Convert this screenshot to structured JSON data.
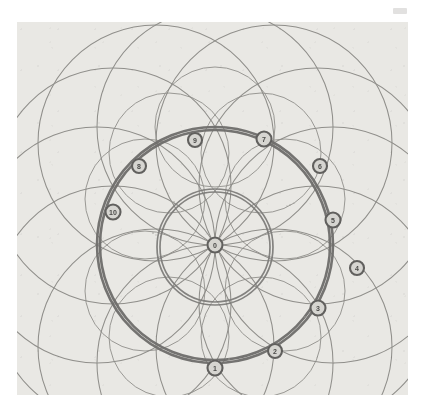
{
  "figure": {
    "background_color": "#ffffff",
    "plate_color": "#e9e8e4",
    "ink_color": "#7b7a77",
    "bold_ink_color": "#6e6d6a",
    "marker_fill": "#d6d5d0",
    "marker_stroke": "#5a5957",
    "label_color": "#4a4a48"
  },
  "geometry": {
    "center": {
      "x": 198,
      "y": 223,
      "label": "center-point"
    },
    "circles": [
      {
        "name": "outer-main-circle",
        "cx": 198,
        "cy": 223,
        "r": 118,
        "weight": "bold"
      },
      {
        "name": "outer-main-circle-shadow",
        "cx": 198,
        "cy": 223,
        "r": 115,
        "weight": "bold"
      },
      {
        "name": "inner-circle",
        "cx": 198,
        "cy": 225,
        "r": 58,
        "weight": "medium"
      },
      {
        "name": "inner-circle-shadow",
        "cx": 198,
        "cy": 225,
        "r": 55,
        "weight": "medium"
      }
    ],
    "arc_circles": [
      {
        "name": "arc-circle-1",
        "cx": 198,
        "cy": 105,
        "r": 118
      },
      {
        "name": "arc-circle-2",
        "cx": 257,
        "cy": 121,
        "r": 118
      },
      {
        "name": "arc-circle-3",
        "cx": 300,
        "cy": 164,
        "r": 118
      },
      {
        "name": "arc-circle-4",
        "cx": 316,
        "cy": 223,
        "r": 118
      },
      {
        "name": "arc-circle-5",
        "cx": 300,
        "cy": 282,
        "r": 118
      },
      {
        "name": "arc-circle-6",
        "cx": 257,
        "cy": 325,
        "r": 118
      },
      {
        "name": "arc-circle-7",
        "cx": 198,
        "cy": 341,
        "r": 118
      },
      {
        "name": "arc-circle-8",
        "cx": 139,
        "cy": 325,
        "r": 118
      },
      {
        "name": "arc-circle-9",
        "cx": 96,
        "cy": 282,
        "r": 118
      },
      {
        "name": "arc-circle-10",
        "cx": 80,
        "cy": 223,
        "r": 118
      },
      {
        "name": "arc-circle-11",
        "cx": 96,
        "cy": 164,
        "r": 118
      },
      {
        "name": "arc-circle-12",
        "cx": 139,
        "cy": 121,
        "r": 118
      }
    ],
    "spiral_arcs": [
      {
        "name": "spiral-arc-a",
        "cx": 198,
        "cy": 105,
        "r": 60
      },
      {
        "name": "spiral-arc-b",
        "cx": 244,
        "cy": 131,
        "r": 60
      },
      {
        "name": "spiral-arc-c",
        "cx": 268,
        "cy": 177,
        "r": 60
      },
      {
        "name": "spiral-arc-d",
        "cx": 268,
        "cy": 269,
        "r": 60
      },
      {
        "name": "spiral-arc-e",
        "cx": 244,
        "cy": 315,
        "r": 60
      },
      {
        "name": "spiral-arc-f",
        "cx": 152,
        "cy": 315,
        "r": 60
      },
      {
        "name": "spiral-arc-g",
        "cx": 128,
        "cy": 269,
        "r": 60
      },
      {
        "name": "spiral-arc-h",
        "cx": 128,
        "cy": 177,
        "r": 60
      },
      {
        "name": "spiral-arc-i",
        "cx": 152,
        "cy": 131,
        "r": 60
      }
    ]
  },
  "markers": [
    {
      "id": "marker-center",
      "label": "0",
      "x": 198,
      "y": 223,
      "r": 7.5,
      "on_ring": "center"
    },
    {
      "id": "marker-1",
      "label": "1",
      "x": 198,
      "y": 346,
      "r": 7.5,
      "on_ring": "outer"
    },
    {
      "id": "marker-2",
      "label": "2",
      "x": 258,
      "y": 329,
      "r": 7.0,
      "on_ring": "outer"
    },
    {
      "id": "marker-3",
      "label": "3",
      "x": 301,
      "y": 286,
      "r": 7.5,
      "on_ring": "outer"
    },
    {
      "id": "marker-4",
      "label": "4",
      "x": 340,
      "y": 246,
      "r": 7.0,
      "on_ring": "outside"
    },
    {
      "id": "marker-5",
      "label": "5",
      "x": 316,
      "y": 198,
      "r": 7.5,
      "on_ring": "outer"
    },
    {
      "id": "marker-6",
      "label": "6",
      "x": 303,
      "y": 144,
      "r": 7.0,
      "on_ring": "outer"
    },
    {
      "id": "marker-7",
      "label": "7",
      "x": 247,
      "y": 117,
      "r": 7.5,
      "on_ring": "outer"
    },
    {
      "id": "marker-9",
      "label": "9",
      "x": 178,
      "y": 118,
      "r": 7.0,
      "on_ring": "outer"
    },
    {
      "id": "marker-8",
      "label": "8",
      "x": 122,
      "y": 144,
      "r": 7.0,
      "on_ring": "outer"
    },
    {
      "id": "marker-10",
      "label": "10",
      "x": 96,
      "y": 190,
      "r": 7.5,
      "on_ring": "outer"
    }
  ],
  "speck_marks": [
    {
      "name": "speck-1",
      "x": 157,
      "y": 180,
      "r": 1.1
    },
    {
      "name": "speck-2",
      "x": 160,
      "y": 183,
      "r": 0.9
    },
    {
      "name": "speck-3",
      "x": 273,
      "y": 183,
      "r": 0.9
    },
    {
      "name": "speck-4",
      "x": 277,
      "y": 181,
      "r": 0.8
    },
    {
      "name": "speck-5",
      "x": 136,
      "y": 211,
      "r": 1.0
    },
    {
      "name": "speck-6",
      "x": 139,
      "y": 213,
      "r": 0.8
    },
    {
      "name": "speck-7",
      "x": 238,
      "y": 264,
      "r": 1.1
    },
    {
      "name": "speck-8",
      "x": 215,
      "y": 280,
      "r": 1.0
    },
    {
      "name": "speck-9",
      "x": 288,
      "y": 295,
      "r": 1.0
    },
    {
      "name": "speck-10",
      "x": 212,
      "y": 337,
      "r": 1.1
    },
    {
      "name": "speck-11",
      "x": 270,
      "y": 184,
      "r": 0.8
    }
  ],
  "corner_mark": {
    "name": "faint-corner-mark",
    "x": 393,
    "y": 8,
    "width": 14,
    "height": 6
  }
}
